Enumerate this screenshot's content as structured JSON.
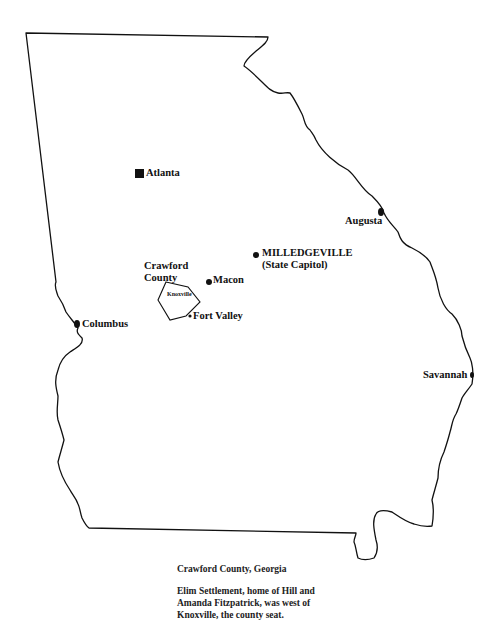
{
  "map": {
    "title": "Georgia",
    "cities": [
      {
        "name": "Atlanta",
        "marker": "square"
      },
      {
        "name": "Augusta",
        "marker": "dot"
      },
      {
        "name": "MILLEDGEVILLE",
        "subtitle": "(State Capitol)",
        "marker": "dot"
      },
      {
        "name": "Macon",
        "marker": "dot"
      },
      {
        "name": "Fort Valley",
        "marker": "small-dot"
      },
      {
        "name": "Columbus",
        "marker": "dot"
      },
      {
        "name": "Savannah",
        "marker": "dot"
      },
      {
        "name": "Knoxville",
        "marker": "none"
      }
    ],
    "county": {
      "line1": "Crawford",
      "line2": "County"
    }
  },
  "caption": {
    "title": "Crawford County, Georgia",
    "line1": "Elim Settlement, home of Hill and",
    "line2": "Amanda Fitzpatrick, was west of",
    "line3": "Knoxville, the county seat."
  }
}
